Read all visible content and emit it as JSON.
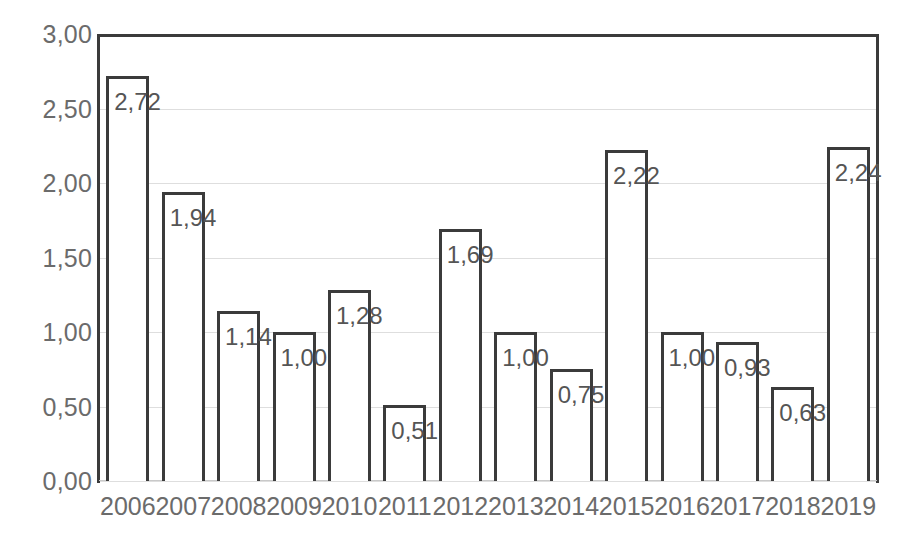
{
  "chart_data": {
    "type": "bar",
    "title": "",
    "subtitle": "",
    "xlabel": "",
    "ylabel": "",
    "categories": [
      "2006",
      "2007",
      "2008",
      "2009",
      "2010",
      "2011",
      "2012",
      "2013",
      "2014",
      "2015",
      "2016",
      "2017",
      "2018",
      "2019"
    ],
    "values": [
      2.72,
      1.94,
      1.14,
      1.0,
      1.28,
      0.51,
      1.69,
      1.0,
      0.75,
      2.22,
      1.0,
      0.93,
      0.63,
      2.24
    ],
    "value_labels": [
      "2,72",
      "1,94",
      "1,14",
      "1,00",
      "1,28",
      "0,51",
      "1,69",
      "1,00",
      "0,75",
      "2,22",
      "1,00",
      "0,93",
      "0,63",
      "2,24"
    ],
    "ylim": [
      0,
      3
    ],
    "ytick_values": [
      0,
      0.5,
      1.0,
      1.5,
      2.0,
      2.5,
      3.0
    ],
    "ytick_labels": [
      "0,00",
      "0,50",
      "1,00",
      "1,50",
      "2,00",
      "2,50",
      "3,00"
    ],
    "grid": true,
    "legend": null,
    "legend_position": "none",
    "decimal_separator": ",",
    "bar_style": "outlined-white",
    "colors": {
      "bar_outline": "#3b3b3b",
      "bar_fill": "#ffffff",
      "gridline": "#dedede",
      "axis_line": "#3b3b3b",
      "tick_label": "#6b6b6b",
      "data_label": "#555555",
      "background": "#ffffff"
    }
  }
}
